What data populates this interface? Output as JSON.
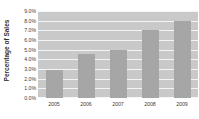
{
  "chart_data": {
    "type": "bar",
    "title": "",
    "xlabel": "",
    "ylabel": "Percentage of Sales",
    "categories": [
      "2005",
      "2006",
      "2007",
      "2008",
      "2009"
    ],
    "values": [
      2.9,
      4.6,
      5.0,
      7.0,
      8.0
    ],
    "series": [
      {
        "name": "Percentage of Sales",
        "values": [
          2.9,
          4.6,
          5.0,
          7.0,
          8.0
        ]
      }
    ],
    "ylim": [
      0.0,
      9.0
    ],
    "ytick_values": [
      9.0,
      8.0,
      7.0,
      6.0,
      5.0,
      4.0,
      3.0,
      2.0,
      1.0,
      0.0
    ],
    "ytick_labels": [
      "9.0%",
      "8.0%",
      "7.0%",
      "6.0%",
      "5.0%",
      "4.0%",
      "3.0%",
      "2.0%",
      "1.0%",
      "0.0%"
    ],
    "grid": true,
    "legend": false,
    "legend_position": "none",
    "colors": {
      "bar": "#a6a6a6",
      "plot_background": "#c9c9c9",
      "gridline": "#f4f4f4",
      "text": "#3b3b3b",
      "axis_title": "#333333",
      "page_background": "#ffffff"
    }
  }
}
